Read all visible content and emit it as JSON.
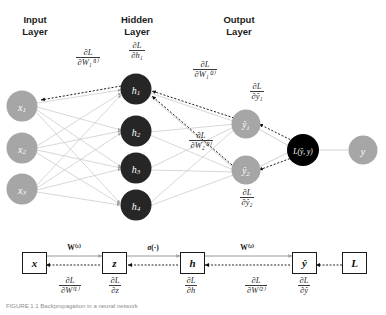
{
  "figure": {
    "title_caption": "FIGURE 1.1  Backpropagation in a neural network",
    "colors": {
      "input_node": "#a6a6a6",
      "hidden_node": "#262626",
      "output_node": "#a6a6a6",
      "loss_node": "#000000",
      "target_node": "#a6a6a6",
      "forward_edge": "#c9c9c9",
      "backward_edge": "#1a1a1a",
      "text": "#1a1a1a"
    }
  },
  "layer_titles": [
    {
      "name": "input-layer-title",
      "text": "Input\nLayer"
    },
    {
      "name": "hidden-layer-title",
      "text": "Hidden\nLayer"
    },
    {
      "name": "output-layer-title",
      "text": "Output\nLayer"
    }
  ],
  "nodes": {
    "input": [
      {
        "id": "x1",
        "label": "x",
        "sub": "1"
      },
      {
        "id": "x2",
        "label": "x",
        "sub": "2"
      },
      {
        "id": "x3",
        "label": "x",
        "sub": "3"
      }
    ],
    "hidden": [
      {
        "id": "h1",
        "label": "h",
        "sub": "1"
      },
      {
        "id": "h2",
        "label": "h",
        "sub": "2"
      },
      {
        "id": "h3",
        "label": "h",
        "sub": "3"
      },
      {
        "id": "h4",
        "label": "h",
        "sub": "4"
      }
    ],
    "output": [
      {
        "id": "y1",
        "label": "ŷ",
        "sub": "1"
      },
      {
        "id": "y2",
        "label": "ŷ",
        "sub": "2"
      }
    ],
    "loss": {
      "id": "loss",
      "label": "L(ŷ, y)"
    },
    "target": {
      "id": "target",
      "label": "y"
    }
  },
  "gradient_labels": {
    "dL_dW1_1": {
      "num": "∂L",
      "den": "∂W₁⁽¹⁾"
    },
    "dL_dh1": {
      "num": "∂L",
      "den": "∂h₁"
    },
    "dL_dW1_2": {
      "num": "∂L",
      "den": "∂W₁⁽²⁾"
    },
    "dL_dW2_2": {
      "num": "∂L",
      "den": "∂W₂⁽²⁾"
    },
    "dL_dy1": {
      "num": "∂L",
      "den": "∂ŷ₁"
    },
    "dL_dy2": {
      "num": "∂L",
      "den": "∂ŷ₂"
    }
  },
  "flow_diagram": {
    "boxes": [
      {
        "id": "box-x",
        "label": "x"
      },
      {
        "id": "box-z",
        "label": "z"
      },
      {
        "id": "box-h",
        "label": "h"
      },
      {
        "id": "box-yhat",
        "label": "ŷ"
      },
      {
        "id": "box-L",
        "label": "L"
      }
    ],
    "edge_labels_top": [
      {
        "id": "w1-label",
        "text": "W⁽¹⁾"
      },
      {
        "id": "sigma-label",
        "text": "σ(·)"
      },
      {
        "id": "w2-label",
        "text": "W⁽²⁾"
      }
    ],
    "gradients_bottom": [
      {
        "id": "grad-dW1",
        "num": "∂L",
        "den": "∂W⁽¹⁾"
      },
      {
        "id": "grad-dz",
        "num": "∂L",
        "den": "∂z"
      },
      {
        "id": "grad-dh",
        "num": "∂L",
        "den": "∂h"
      },
      {
        "id": "grad-dW2",
        "num": "∂L",
        "den": "∂W⁽²⁾"
      },
      {
        "id": "grad-dyhat",
        "num": "∂L",
        "den": "∂ŷ"
      }
    ]
  }
}
